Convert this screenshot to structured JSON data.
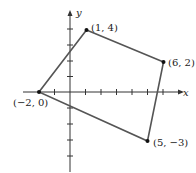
{
  "figure": {
    "type": "quadrilateral-on-coordinate-plane",
    "axes": {
      "x_label": "x",
      "y_label": "y",
      "x_ticks": [
        -3,
        -2,
        -1,
        1,
        2,
        3,
        4,
        5,
        6,
        7
      ],
      "y_ticks": [
        -4,
        -3,
        -2,
        -1,
        1,
        2,
        3,
        4
      ]
    },
    "vertices": [
      {
        "label": "(1, 4)",
        "x": 1,
        "y": 4
      },
      {
        "label": "(6, 2)",
        "x": 6,
        "y": 2
      },
      {
        "label": "(5, −3)",
        "x": 5,
        "y": -3
      },
      {
        "label": "(−2, 0)",
        "x": -2,
        "y": 0
      }
    ],
    "colors": {
      "polygon": "#555555",
      "axes": "#333333",
      "points": "#111111"
    }
  }
}
